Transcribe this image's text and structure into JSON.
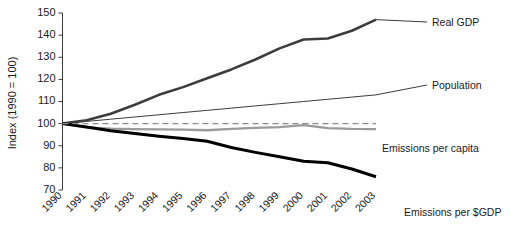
{
  "chart_data": {
    "type": "line",
    "title": "",
    "xlabel": "",
    "ylabel": "Index (1990 = 100)",
    "ylim": [
      70,
      150
    ],
    "ytick_values": [
      70,
      80,
      90,
      100,
      110,
      120,
      130,
      140,
      150
    ],
    "ytick_labels": [
      "70",
      "80",
      "90",
      "100",
      "110",
      "120",
      "130",
      "140",
      "150"
    ],
    "grid": false,
    "legend_position": "right-inline-labels",
    "categories": [
      "1990",
      "1991",
      "1992",
      "1993",
      "1994",
      "1995",
      "1996",
      "1997",
      "1998",
      "1999",
      "2000",
      "2001",
      "2002",
      "2003"
    ],
    "series": [
      {
        "name": "Real GDP",
        "color": "#3c3c3c",
        "width": 2.6,
        "style": "solid",
        "values": [
          100,
          101.5,
          104.5,
          108.5,
          113,
          116.5,
          120.5,
          124.5,
          129,
          134,
          138,
          138.5,
          142,
          147
        ]
      },
      {
        "name": "Population",
        "color": "#3c3c3c",
        "width": 1.0,
        "style": "solid",
        "values": [
          100,
          101,
          102,
          103,
          104,
          105,
          106,
          107,
          108,
          109,
          110,
          111,
          112,
          113
        ]
      },
      {
        "name": "Emissions per capita",
        "color": "#9a9a9a",
        "width": 2.3,
        "style": "solid",
        "values": [
          100,
          98.3,
          97.7,
          97.5,
          97.4,
          97.3,
          97.0,
          97.6,
          98.1,
          98.4,
          99.3,
          98.0,
          97.6,
          97.5
        ]
      },
      {
        "name": "Emissions per $GDP",
        "color": "#000000",
        "width": 3.0,
        "style": "solid",
        "values": [
          100,
          98.5,
          96.8,
          95.5,
          94.3,
          93.3,
          92.0,
          89.2,
          87.0,
          85.0,
          83.0,
          82.3,
          79.5,
          76.0
        ]
      },
      {
        "name": "reference-100",
        "color": "#8a8a8a",
        "width": 1.4,
        "style": "dashed",
        "values": [
          100,
          100,
          100,
          100,
          100,
          100,
          100,
          100,
          100,
          100,
          100,
          100,
          100,
          100
        ]
      }
    ],
    "series_labels": [
      {
        "text": "Real GDP",
        "for": "Real GDP"
      },
      {
        "text": "Population",
        "for": "Population"
      },
      {
        "text": "Emissions per capita",
        "for": "Emissions per capita"
      },
      {
        "text": "Emissions per $GDP",
        "for": "Emissions per $GDP"
      }
    ]
  }
}
